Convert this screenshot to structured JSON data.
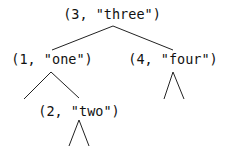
{
  "diagram": {
    "type": "binary-search-tree",
    "line_color": "#222222",
    "text_color": "#111111",
    "nodes": {
      "root": {
        "label": "(3, \"three\")",
        "key": 3,
        "value": "three"
      },
      "left": {
        "label": "(1, \"one\")",
        "key": 1,
        "value": "one"
      },
      "right": {
        "label": "(4, \"four\")",
        "key": 4,
        "value": "four"
      },
      "left_right": {
        "label": "(2, \"two\")",
        "key": 2,
        "value": "two"
      }
    },
    "edges": [
      {
        "from": "root",
        "to": "left"
      },
      {
        "from": "root",
        "to": "right"
      },
      {
        "from": "left",
        "to": "left_right"
      }
    ],
    "subtree_placeholders": [
      "left",
      "right",
      "left_right"
    ]
  }
}
